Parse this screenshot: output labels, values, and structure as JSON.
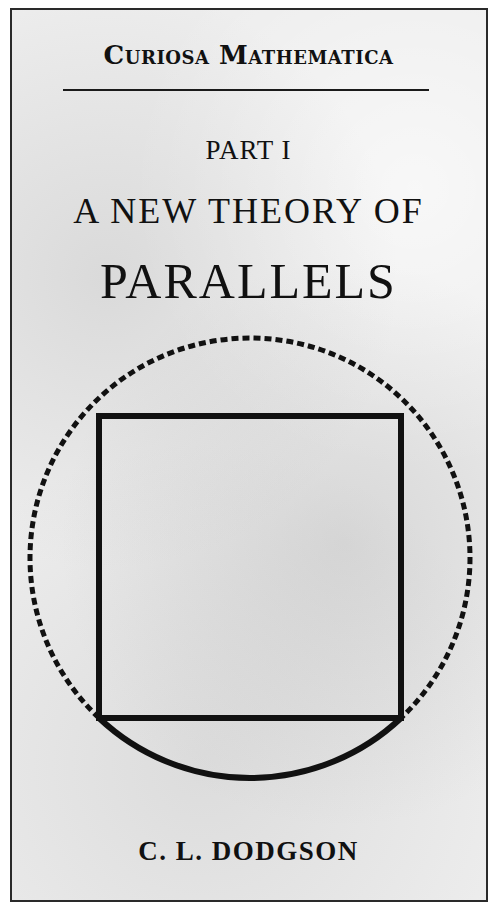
{
  "cover": {
    "series_title": "Curiosa Mathematica",
    "part": "PART I",
    "subtitle": "A NEW THEORY OF",
    "title": "PARALLELS",
    "author": "C. L. DODGSON"
  },
  "figure": {
    "circle": {
      "cx": 250,
      "cy": 563,
      "r": 220,
      "color": "#111111"
    },
    "square": {
      "x": 99,
      "y": 416,
      "width": 302,
      "height": 302,
      "color": "#111111"
    }
  }
}
